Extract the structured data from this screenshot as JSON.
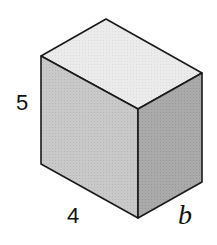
{
  "figure": {
    "type": "rectangular prism",
    "colors": {
      "top_face": "#e9e9e9",
      "front_face": "#c6c6c6",
      "side_face": "#a8a8a8",
      "edge": "#1a1a1a",
      "background": "#ffffff"
    },
    "labels": {
      "height": "5",
      "length": "4",
      "width": "b"
    }
  }
}
